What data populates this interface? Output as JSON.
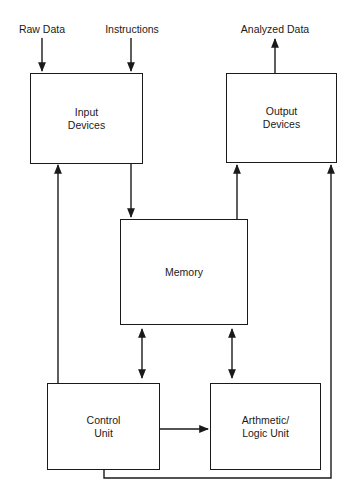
{
  "diagram": {
    "type": "block-diagram",
    "title": "",
    "inputs": [
      {
        "id": "raw-data",
        "label": "Raw Data",
        "x": 42,
        "y": 22
      },
      {
        "id": "instructions",
        "label": "Instructions",
        "x": 132,
        "y": 22
      }
    ],
    "outputs": [
      {
        "id": "analyzed-data",
        "label": "Analyzed Data",
        "x": 274,
        "y": 22
      }
    ],
    "nodes": {
      "input_devices": {
        "line1": "Input",
        "line2": "Devices"
      },
      "output_devices": {
        "line1": "Output",
        "line2": "Devices"
      },
      "memory": {
        "line1": "Memory"
      },
      "control_unit": {
        "line1": "Control",
        "line2": "Unit"
      },
      "alu": {
        "line1": "Arthmetic/",
        "line2": "Logic Unit"
      }
    },
    "edges": [
      {
        "from": "Raw Data",
        "to": "Input Devices",
        "direction": "one-way"
      },
      {
        "from": "Instructions",
        "to": "Input Devices",
        "direction": "one-way"
      },
      {
        "from": "Output Devices",
        "to": "Analyzed Data",
        "direction": "one-way"
      },
      {
        "from": "Input Devices",
        "to": "Memory",
        "direction": "one-way"
      },
      {
        "from": "Memory",
        "to": "Output Devices",
        "direction": "one-way"
      },
      {
        "from": "Control Unit",
        "to": "Input Devices",
        "direction": "one-way"
      },
      {
        "from": "Control Unit",
        "to": "Output Devices",
        "direction": "one-way"
      },
      {
        "from": "Memory",
        "to": "Control Unit",
        "direction": "two-way"
      },
      {
        "from": "Memory",
        "to": "Arthmetic/Logic Unit",
        "direction": "two-way"
      },
      {
        "from": "Control Unit",
        "to": "Arthmetic/Logic Unit",
        "direction": "one-way"
      }
    ],
    "colors": {
      "stroke": "#1a1a1a",
      "background": "#ffffff"
    }
  }
}
